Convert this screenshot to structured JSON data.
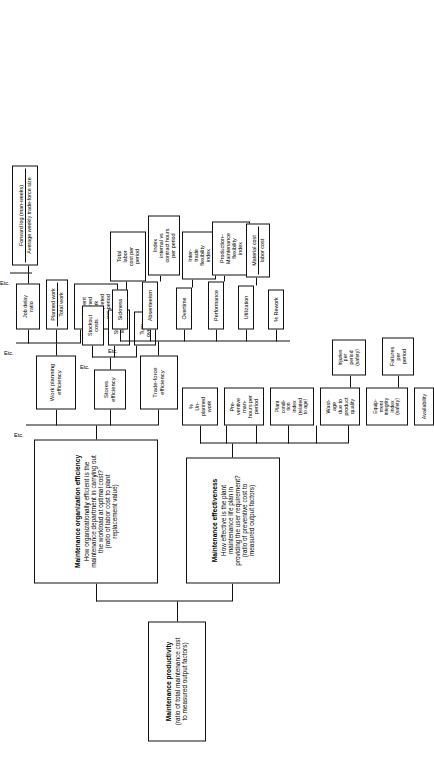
{
  "diagram": {
    "orientation": "rotated-90-ccw",
    "root": {
      "header": "Maintenance productivity",
      "subtitle": "(ratio of total maintenance cost\nto measured output factors)"
    },
    "branch_effectiveness": {
      "header": "Maintenance effectiveness",
      "subtitle": "How effective is the plant\nmaintenance life plan in\nproviding the user requirement?\n(ratio of preventive cost to\nmeasured output factors)"
    },
    "branch_organization": {
      "header": "Maintenance organization efficiency",
      "subtitle": "How organizationally efficient is the\nmaintenance department in carrying out\nthe workload at optimal cost?\n(ratio of labor cost to plant\nreplacement value)"
    },
    "effectiveness_leaves": [
      {
        "label": "Availability"
      },
      {
        "label": "Equip-\nment\nintegrity\nindex\n(safety)"
      },
      {
        "label": "Wast-\nage\ndue to\nproduct\nquality"
      },
      {
        "label": "Plant\ncondi-\ntion\nindex\n(related\nto age)"
      },
      {
        "label": "Pre-\nventive\nman-\nhours per\nperiod"
      },
      {
        "label": "%\nUn-\nplanned\nwork"
      }
    ],
    "effectiveness_subleaves": [
      {
        "label": "Failures\nper\nperiod"
      },
      {
        "label": "Injuries\nper\nperiod\n(safety)"
      }
    ],
    "organization_children": [
      {
        "label": "Trade-force\nefficiency"
      },
      {
        "label": "Stores\nefficiency"
      },
      {
        "label": "Work planning\nefficiency"
      }
    ],
    "tradeforce_leaves": [
      {
        "label": "% Rework"
      },
      {
        "label": "Utilization"
      },
      {
        "label": "Performance"
      },
      {
        "label": "Overtime"
      },
      {
        "label": "Absenteeism"
      },
      {
        "label": "Sickness"
      }
    ],
    "tradeforce_ratios": [
      {
        "numerator": "Material cost",
        "denominator": "labor cost"
      },
      {
        "label": "Production–\nMaintenance\nflexibility\nindex"
      },
      {
        "label": "Inter-\ntrade\nflexibility\nindex"
      },
      {
        "label": "Index\ninternal vs\ncontract hours\nper period"
      },
      {
        "label": "Total\nlabor\ncost per\nperiod"
      }
    ],
    "stores_leaves": [
      {
        "label": "Turn-\nover %"
      },
      {
        "label": "Stock\nlevel"
      },
      {
        "label": "Stockout\ncosts"
      }
    ],
    "planning_leaves": [
      {
        "label": "Percent\nplanned\nwork\ncompleted\nper period"
      },
      {
        "numerator": "Planned work",
        "denominator": "Total work"
      },
      {
        "label": "Job delay\nratio"
      }
    ],
    "planning_ratio_leaf": {
      "numerator": "Forward log (man-weeks)",
      "denominator": "Average weekly trade-force size"
    },
    "etc_labels": [
      {
        "label": "Etc.",
        "for": "organization-children"
      },
      {
        "label": "Etc.",
        "for": "stores-leaves"
      },
      {
        "label": "Etc.",
        "for": "tradeforce-leaves"
      },
      {
        "label": "Etc.",
        "for": "planning-leaves"
      }
    ],
    "colors": {
      "line": "#111111",
      "box_fill": "#ffffff",
      "text": "#000000",
      "background": "#ffffff"
    }
  }
}
